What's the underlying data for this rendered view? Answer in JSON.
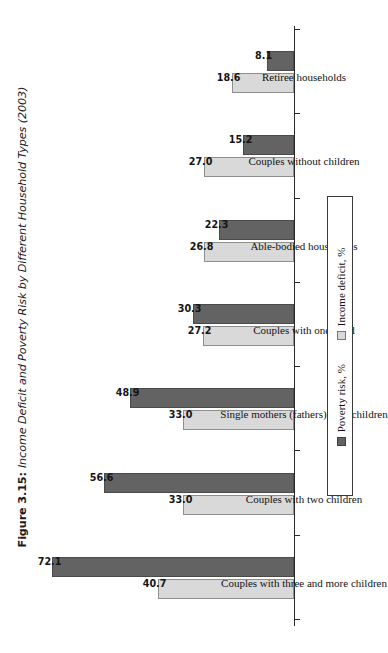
{
  "figure": {
    "label": "Figure 3.15:",
    "title": "Income Deficit and Poverty Risk by Different Household Types (2003)",
    "full_caption": "Figure 3.15: Income Deficit and Poverty Risk by Different Household Types (2003)"
  },
  "legend": {
    "items": [
      {
        "label": "Income deficit, %",
        "swatch": "light-gray-swatch",
        "color": "#d9d9d9"
      },
      {
        "label": "Poverty risk, %",
        "swatch": "dark-gray-swatch",
        "color": "#636363"
      }
    ]
  },
  "chart_data": {
    "type": "bar",
    "orientation": "rotated-vertical",
    "title": "Income Deficit and Poverty Risk by Different Household Types (2003)",
    "xlabel": "",
    "ylabel": "",
    "ylim": [
      0,
      80
    ],
    "grid": false,
    "legend_position": "right",
    "categories": [
      "Couples with three and more children",
      "Couples with two children",
      "Single mothers (fathers) with children",
      "Couples with one child",
      "Able-bodied households",
      "Couples without children",
      "Retiree households"
    ],
    "series": [
      {
        "name": "Income deficit, %",
        "color": "#d9d9d9",
        "values": [
          40.7,
          33.0,
          33.0,
          27.2,
          26.8,
          27.0,
          18.6
        ],
        "labels": [
          "40.7",
          "33.0",
          "33.0",
          "27.2",
          "26.8",
          "27.0",
          "18.6"
        ]
      },
      {
        "name": "Poverty risk, %",
        "color": "#636363",
        "values": [
          72.1,
          56.6,
          48.9,
          30.3,
          22.3,
          15.2,
          8.1
        ],
        "labels": [
          "72.1",
          "56.6",
          "48.9",
          "30.3",
          "22.3",
          "15.2",
          "8.1"
        ]
      }
    ]
  }
}
